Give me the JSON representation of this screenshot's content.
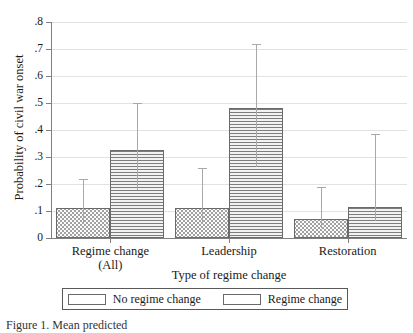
{
  "chart_data": {
    "type": "bar",
    "title": "",
    "xlabel": "Type of regime change",
    "ylabel": "Probability of civil war onset",
    "categories": [
      "Regime change\n(All)",
      "Leadership",
      "Restoration"
    ],
    "category_labels": [
      {
        "line1": "Regime change",
        "line2": "(All)"
      },
      {
        "line1": "Leadership",
        "line2": ""
      },
      {
        "line1": "Restoration",
        "line2": ""
      }
    ],
    "ylim": [
      0,
      0.8
    ],
    "yticks": [
      0,
      0.1,
      0.2,
      0.3,
      0.4,
      0.5,
      0.6,
      0.7,
      0.8
    ],
    "ytick_labels": [
      "0",
      ".1",
      ".2",
      ".3",
      ".4",
      ".5",
      ".6",
      ".7",
      ".8"
    ],
    "grid": true,
    "legend_position": "bottom",
    "series": [
      {
        "name": "No regime change",
        "pattern": "dotted",
        "values": [
          0.11,
          0.11,
          0.07
        ],
        "error_high": [
          0.22,
          0.26,
          0.19
        ]
      },
      {
        "name": "Regime change",
        "pattern": "horizontal-lines",
        "values": [
          0.325,
          0.48,
          0.115
        ],
        "error_high": [
          0.5,
          0.72,
          0.385
        ]
      }
    ]
  },
  "legend": {
    "items": [
      {
        "label": "No regime change",
        "pattern": "dotted"
      },
      {
        "label": "Regime change",
        "pattern": "horizontal-lines"
      }
    ]
  },
  "caption": {
    "text": "Figure 1. Mean predicted "
  },
  "colors": {
    "axis": "#808080",
    "grid": "#e2e2e2",
    "bar_border": "#6a6a6a",
    "error_bar": "#a8a8a8",
    "text": "#1a1a1a"
  }
}
